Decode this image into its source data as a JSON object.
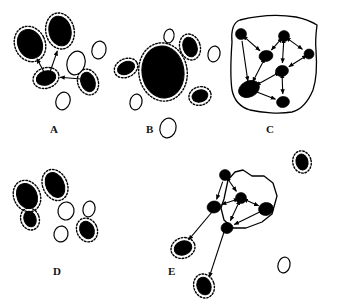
{
  "figure": {
    "background_color": "#ffffff",
    "ink_color": "#000000",
    "width": 341,
    "height": 304,
    "panel_labels": [
      {
        "id": "A",
        "text": "A",
        "x": 50,
        "y": 124
      },
      {
        "id": "B",
        "text": "B",
        "x": 146,
        "y": 124
      },
      {
        "id": "C",
        "text": "C",
        "x": 266,
        "y": 124
      },
      {
        "id": "D",
        "text": "D",
        "x": 53,
        "y": 266
      },
      {
        "id": "E",
        "text": "E",
        "x": 168,
        "y": 266
      }
    ],
    "legend_semantics": {
      "filled_ellipse": "active cell (solid black)",
      "dashed_halo": "activation halo around cell",
      "open_ellipse": "inactive cell (outline only)",
      "arrow": "directed interaction",
      "blob_outline": "cluster boundary"
    }
  },
  "panels": {
    "A": {
      "label": "A",
      "description": "Loosely connected cells with a few directed interactions",
      "cells": [
        {
          "name": "cell-a1",
          "cx": 30,
          "cy": 44,
          "rx": 12,
          "ry": 15,
          "rot": -25,
          "fill": "solid",
          "halo": true
        },
        {
          "name": "cell-a2",
          "cx": 60,
          "cy": 31,
          "rx": 11,
          "ry": 15,
          "rot": -12,
          "fill": "solid",
          "halo": true
        },
        {
          "name": "cell-a3",
          "cx": 46,
          "cy": 78,
          "rx": 10,
          "ry": 7,
          "rot": -18,
          "fill": "solid",
          "halo": true
        },
        {
          "name": "cell-a4",
          "cx": 88,
          "cy": 82,
          "rx": 7,
          "ry": 10,
          "rot": -20,
          "fill": "solid",
          "halo": true
        },
        {
          "name": "cell-a5",
          "cx": 76,
          "cy": 63,
          "rx": 9,
          "ry": 12,
          "rot": 15,
          "fill": "open",
          "halo": false
        },
        {
          "name": "cell-a6",
          "cx": 99,
          "cy": 50,
          "rx": 7,
          "ry": 9,
          "rot": 15,
          "fill": "open",
          "halo": false
        },
        {
          "name": "cell-a7",
          "cx": 63,
          "cy": 101,
          "rx": 7,
          "ry": 9,
          "rot": 20,
          "fill": "open",
          "halo": false
        }
      ],
      "arrows": [
        {
          "name": "arrow-a3-to-a1",
          "x1": 44,
          "y1": 72,
          "x2": 36,
          "y2": 57
        },
        {
          "name": "arrow-a3-to-a2",
          "x1": 50,
          "y1": 72,
          "x2": 58,
          "y2": 49
        },
        {
          "name": "arrow-a4-to-a3",
          "x1": 81,
          "y1": 79,
          "x2": 58,
          "y2": 77
        }
      ]
    },
    "B": {
      "label": "B",
      "description": "One dominant large cell with small satellites and inactive cells",
      "cells": [
        {
          "name": "cell-b-large",
          "cx": 163,
          "cy": 72,
          "rx": 21,
          "ry": 26,
          "rot": -8,
          "fill": "solid",
          "halo": true
        },
        {
          "name": "cell-b2",
          "cx": 126,
          "cy": 68,
          "rx": 9,
          "ry": 6,
          "rot": -25,
          "fill": "solid",
          "halo": true
        },
        {
          "name": "cell-b3",
          "cx": 190,
          "cy": 47,
          "rx": 7,
          "ry": 10,
          "rot": -18,
          "fill": "solid",
          "halo": true
        },
        {
          "name": "cell-b4",
          "cx": 200,
          "cy": 96,
          "rx": 8,
          "ry": 6,
          "rot": -15,
          "fill": "solid",
          "halo": true
        },
        {
          "name": "cell-b5",
          "cx": 169,
          "cy": 36,
          "rx": 5,
          "ry": 7,
          "rot": 12,
          "fill": "open",
          "halo": false
        },
        {
          "name": "cell-b6",
          "cx": 214,
          "cy": 54,
          "rx": 6,
          "ry": 8,
          "rot": 12,
          "fill": "open",
          "halo": false
        },
        {
          "name": "cell-b7",
          "cx": 136,
          "cy": 102,
          "rx": 6,
          "ry": 8,
          "rot": 12,
          "fill": "open",
          "halo": false
        },
        {
          "name": "cell-b8",
          "cx": 168,
          "cy": 128,
          "rx": 8,
          "ry": 10,
          "rot": 15,
          "fill": "open",
          "halo": false
        }
      ],
      "arrows": []
    },
    "C": {
      "label": "C",
      "description": "Fully enclosed cluster with a dense bidirectional interaction network",
      "blob": "M 232 42 C 231 30 234 22 240 20 C 256 16 278 14 296 17 C 306 19 312 22 317 25 C 316 33 315 41 316 50 C 317 64 317 78 313 90 C 308 102 300 110 292 112 C 280 114 262 113 250 110 C 240 107 234 100 232 90 C 230 76 231 56 232 42 Z",
      "nodes": [
        {
          "name": "node-c1",
          "cx": 241,
          "cy": 34,
          "r": 5.5
        },
        {
          "name": "node-c2",
          "cx": 284,
          "cy": 36,
          "r": 5.5
        },
        {
          "name": "node-c3",
          "cx": 266,
          "cy": 56,
          "rx": 7,
          "ry": 5.5,
          "rot": -10
        },
        {
          "name": "node-c4",
          "cx": 309,
          "cy": 54,
          "r": 5
        },
        {
          "name": "node-c5",
          "cx": 282,
          "cy": 71,
          "rx": 6.5,
          "ry": 5.5,
          "rot": -10
        },
        {
          "name": "node-c6",
          "cx": 249,
          "cy": 89,
          "rx": 11,
          "ry": 8,
          "rot": -25
        },
        {
          "name": "node-c7",
          "cx": 283,
          "cy": 102,
          "rx": 6.5,
          "ry": 5.5,
          "rot": -10
        }
      ],
      "edges": [
        {
          "name": "edge-c1-c3",
          "x1": 241,
          "y1": 34,
          "x2": 266,
          "y2": 56,
          "both": true
        },
        {
          "name": "edge-c2-c3",
          "x1": 284,
          "y1": 36,
          "x2": 266,
          "y2": 56,
          "both": true
        },
        {
          "name": "edge-c2-c4",
          "x1": 284,
          "y1": 36,
          "x2": 309,
          "y2": 54,
          "both": true
        },
        {
          "name": "edge-c2-c5",
          "x1": 284,
          "y1": 36,
          "x2": 282,
          "y2": 71,
          "both": true
        },
        {
          "name": "edge-c4-c5",
          "x1": 309,
          "y1": 54,
          "x2": 282,
          "y2": 71,
          "both": true
        },
        {
          "name": "edge-c3-c6",
          "x1": 266,
          "y1": 56,
          "x2": 249,
          "y2": 89,
          "both": true
        },
        {
          "name": "edge-c5-c6",
          "x1": 282,
          "y1": 71,
          "x2": 249,
          "y2": 89,
          "both": true
        },
        {
          "name": "edge-c5-c7",
          "x1": 282,
          "y1": 71,
          "x2": 283,
          "y2": 102,
          "both": true
        },
        {
          "name": "edge-c6-c7",
          "x1": 249,
          "y1": 89,
          "x2": 283,
          "y2": 102,
          "both": true
        },
        {
          "name": "edge-c1-c6",
          "x1": 241,
          "y1": 34,
          "x2": 249,
          "y2": 89,
          "both": false
        }
      ]
    },
    "D": {
      "label": "D",
      "description": "Dispersed cells, no interactions, mix of active and inactive",
      "cells": [
        {
          "name": "cell-d1",
          "cx": 27,
          "cy": 196,
          "rx": 10,
          "ry": 13,
          "rot": -25,
          "fill": "solid",
          "halo": true
        },
        {
          "name": "cell-d2",
          "cx": 55,
          "cy": 185,
          "rx": 9,
          "ry": 13,
          "rot": -25,
          "fill": "solid",
          "halo": true
        },
        {
          "name": "cell-d3",
          "cx": 30,
          "cy": 219,
          "rx": 6,
          "ry": 8,
          "rot": -20,
          "fill": "solid",
          "halo": true
        },
        {
          "name": "cell-d4",
          "cx": 87,
          "cy": 230,
          "rx": 7,
          "ry": 9,
          "rot": -25,
          "fill": "solid",
          "halo": true
        },
        {
          "name": "cell-d5",
          "cx": 66,
          "cy": 211,
          "rx": 8,
          "ry": 9,
          "rot": 10,
          "fill": "open",
          "halo": false
        },
        {
          "name": "cell-d6",
          "cx": 89,
          "cy": 209,
          "rx": 6,
          "ry": 8,
          "rot": 12,
          "fill": "open",
          "halo": false
        },
        {
          "name": "cell-d7",
          "cx": 61,
          "cy": 234,
          "rx": 7,
          "ry": 8,
          "rot": 12,
          "fill": "open",
          "halo": false
        }
      ],
      "arrows": []
    },
    "E": {
      "label": "E",
      "description": "Cluster with internal network plus outgoing arrows to two detached cells",
      "blob": "M 219 196 C 217 186 218 180 221 176 L 229 168 C 233 164 239 168 244 171 C 252 176 262 174 268 177 C 276 181 277 189 276 197 C 275 206 272 214 266 219 C 258 225 244 228 234 228 C 226 228 221 222 220 214 C 219 206 220 200 219 196 Z",
      "blob_points": "224,199 228,180 235,172 243,170 252,176 264,176 273,183 277,196 272,214 262,222 246,228 233,228 224,220 221,208",
      "nodes": [
        {
          "name": "node-e1",
          "cx": 225,
          "cy": 175,
          "r": 5.5
        },
        {
          "name": "node-e2",
          "cx": 241,
          "cy": 198,
          "r": 5.5
        },
        {
          "name": "node-e3",
          "cx": 214,
          "cy": 207,
          "rx": 7,
          "ry": 6,
          "rot": -10
        },
        {
          "name": "node-e4",
          "cx": 266,
          "cy": 209,
          "rx": 7.5,
          "ry": 6.5,
          "rot": -10
        },
        {
          "name": "node-e5",
          "cx": 227,
          "cy": 228,
          "rx": 6,
          "ry": 5.5,
          "rot": -10
        }
      ],
      "edges": [
        {
          "name": "edge-e1-e2",
          "x1": 225,
          "y1": 175,
          "x2": 241,
          "y2": 198,
          "both": true
        },
        {
          "name": "edge-e2-e3",
          "x1": 241,
          "y1": 198,
          "x2": 214,
          "y2": 207,
          "both": true
        },
        {
          "name": "edge-e2-e4",
          "x1": 241,
          "y1": 198,
          "x2": 266,
          "y2": 209,
          "both": true
        },
        {
          "name": "edge-e2-e5",
          "x1": 241,
          "y1": 198,
          "x2": 227,
          "y2": 228,
          "both": true
        },
        {
          "name": "edge-e1-e3",
          "x1": 225,
          "y1": 175,
          "x2": 214,
          "y2": 207,
          "both": false
        },
        {
          "name": "edge-e4-e5",
          "x1": 266,
          "y1": 209,
          "x2": 227,
          "y2": 228,
          "both": true
        }
      ],
      "outgoing_arrows": [
        {
          "name": "arrow-e-to-out1",
          "x1": 212,
          "y1": 212,
          "x2": 186,
          "y2": 243
        },
        {
          "name": "arrow-e-to-out2",
          "x1": 224,
          "y1": 232,
          "x2": 208,
          "y2": 281
        }
      ],
      "detached_cells": [
        {
          "name": "cell-e-out1",
          "cx": 183,
          "cy": 248,
          "rx": 9,
          "ry": 7,
          "rot": -20,
          "fill": "solid",
          "halo": true
        },
        {
          "name": "cell-e-out2",
          "cx": 204,
          "cy": 286,
          "rx": 7,
          "ry": 9,
          "rot": -18,
          "fill": "solid",
          "halo": true
        }
      ]
    }
  },
  "free_cells": [
    {
      "name": "free-cell-top-right",
      "cx": 302,
      "cy": 162,
      "rx": 6,
      "ry": 8,
      "rot": -12,
      "fill": "solid",
      "halo": true
    },
    {
      "name": "free-cell-bottom-right",
      "cx": 284,
      "cy": 265,
      "rx": 6,
      "ry": 8,
      "rot": 14,
      "fill": "open",
      "halo": false
    }
  ]
}
